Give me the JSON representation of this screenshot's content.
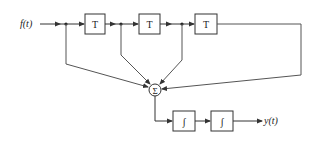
{
  "diagram": {
    "title": "",
    "input_label": "f(t)",
    "output_label": "y(t)",
    "delay_blocks": [
      {
        "label": "T"
      },
      {
        "label": "T"
      },
      {
        "label": "T"
      }
    ],
    "summer": {
      "label": "Σ"
    },
    "integrator_blocks": [
      {
        "label": "∫"
      },
      {
        "label": "∫"
      }
    ],
    "colors": {
      "line": "#333333",
      "background": "#ffffff"
    }
  }
}
